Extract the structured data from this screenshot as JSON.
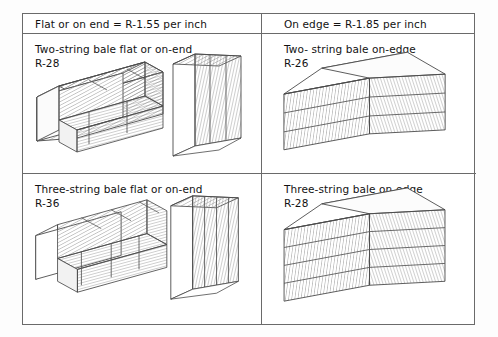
{
  "table": {
    "headers": [
      {
        "label": "Flat or on end = R-1.55 per inch"
      },
      {
        "label": "On edge = R-1.85 per inch"
      }
    ],
    "cells": [
      {
        "id": "two-string-flat",
        "label": "Two-string bale flat or on-end\nR-28",
        "title": "Two-string bale flat or on-end",
        "r_value": "R-28",
        "figures": [
          "bale-flat-two-string",
          "bale-on-end-two-string"
        ]
      },
      {
        "id": "two-string-on-edge",
        "label": "Two- string bale on-edge\nR-26",
        "title": "Two- string bale on-edge",
        "r_value": "R-26",
        "figures": [
          "bale-on-edge-two-string"
        ]
      },
      {
        "id": "three-string-flat",
        "label": "Three-string bale flat or on-end\nR-36",
        "title": "Three-string bale flat or on-end",
        "r_value": "R-36",
        "figures": [
          "bale-flat-three-string",
          "bale-on-end-three-string"
        ]
      },
      {
        "id": "three-string-on-edge",
        "label": "Three-string bale on-edge\nR-28",
        "title": "Three-string bale on-edge",
        "r_value": "R-28",
        "figures": [
          "bale-on-edge-three-string"
        ]
      }
    ]
  },
  "colors": {
    "background": "#fdfdfd",
    "paper": "#ffffff",
    "rule": "#6a6a6a",
    "ink": "#121212",
    "hatch": "#7d7d7d",
    "outline": "#4a4a4a",
    "face_light": "#ffffff",
    "face_shade": "#f2f2f2"
  }
}
